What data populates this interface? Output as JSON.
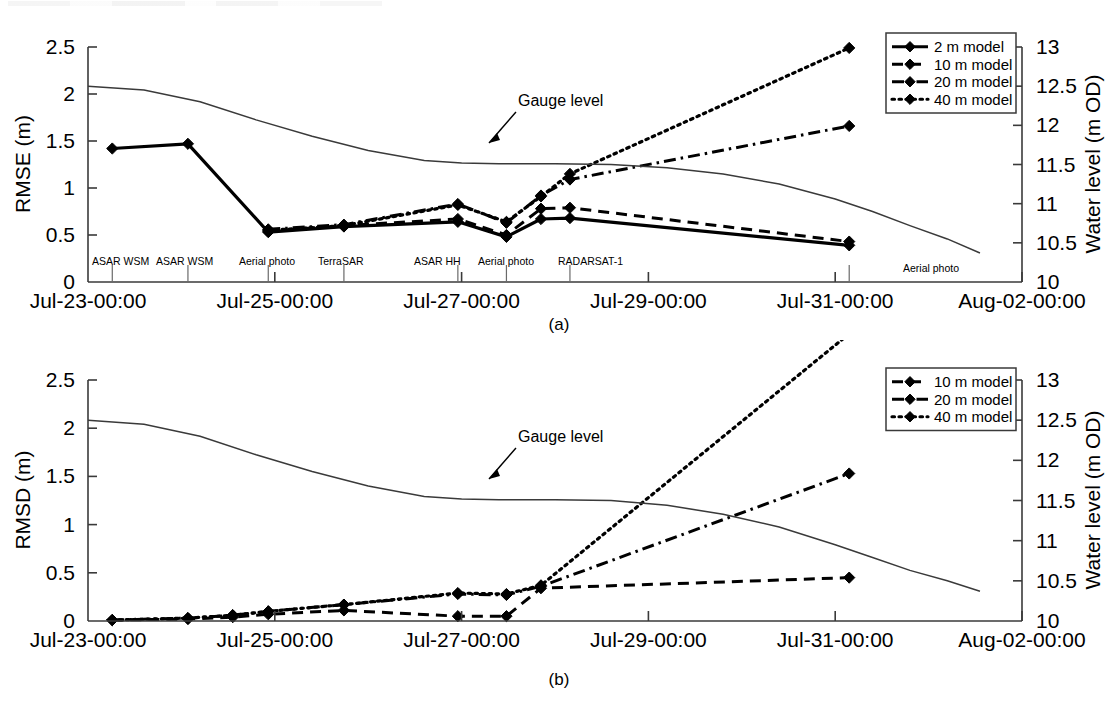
{
  "figure": {
    "width": 1119,
    "height": 712,
    "background": "#ffffff",
    "ink_color": "#000000"
  },
  "panels": [
    {
      "id": "a",
      "caption": "(a)",
      "left_axis_title": "RMSE (m)",
      "right_axis_title": "Water level (m OD)",
      "left_ticks": [
        "0",
        "0.5",
        "1",
        "1.5",
        "2",
        "2.5"
      ],
      "right_ticks": [
        "10",
        "10.5",
        "11",
        "11.5",
        "12",
        "12.5",
        "13"
      ],
      "x_ticks": [
        "Jul-23-00:00",
        "Jul-25-00:00",
        "Jul-27-00:00",
        "Jul-29-00:00",
        "Jul-31-00:00",
        "Aug-02-00:00"
      ],
      "gauge_annotation": "Gauge level",
      "event_labels": [
        "ASAR WSM",
        "ASAR WSM",
        "Aerial photo",
        "TerraSAR",
        "ASAR HH",
        "Aerial photo",
        "RADARSAT-1",
        "Aerial photo"
      ],
      "legend": [
        {
          "label": "2 m model",
          "style": "solid"
        },
        {
          "label": "10 m model",
          "style": "dash"
        },
        {
          "label": "20 m model",
          "style": "dashdot"
        },
        {
          "label": "40 m model",
          "style": "dot"
        }
      ]
    },
    {
      "id": "b",
      "caption": "(b)",
      "left_axis_title": "RMSD (m)",
      "right_axis_title": "Water level (m OD)",
      "left_ticks": [
        "0",
        "0.5",
        "1",
        "1.5",
        "2",
        "2.5"
      ],
      "right_ticks": [
        "10",
        "10.5",
        "11",
        "11.5",
        "12",
        "12.5",
        "13"
      ],
      "x_ticks": [
        "Jul-23-00:00",
        "Jul-25-00:00",
        "Jul-27-00:00",
        "Jul-29-00:00",
        "Jul-31-00:00",
        "Aug-02-00:00"
      ],
      "gauge_annotation": "Gauge level",
      "event_labels": [],
      "legend": [
        {
          "label": "10 m model",
          "style": "dash"
        },
        {
          "label": "20 m model",
          "style": "dashdot"
        },
        {
          "label": "40 m model",
          "style": "dot"
        }
      ]
    }
  ],
  "chart_data": [
    {
      "type": "line",
      "panel": "a",
      "title": "",
      "xlabel": "",
      "ylabel": "RMSE (m)",
      "y2label": "Water level (m OD)",
      "xlim": [
        0,
        10
      ],
      "ylim": [
        0,
        2.5
      ],
      "y2lim": [
        10,
        13
      ],
      "xtick_values": [
        0,
        2,
        4,
        6,
        8,
        10
      ],
      "xtick_labels": [
        "Jul-23-00:00",
        "Jul-25-00:00",
        "Jul-27-00:00",
        "Jul-29-00:00",
        "Jul-31-00:00",
        "Aug-02-00:00"
      ],
      "ytick_values": [
        0,
        0.5,
        1,
        1.5,
        2,
        2.5
      ],
      "y2tick_values": [
        10,
        10.5,
        11,
        11.5,
        12,
        12.5,
        13
      ],
      "grid": false,
      "legend_position": "top-right",
      "series": [
        {
          "name": "2 m model",
          "style": "solid",
          "marker": "diamond",
          "axis": "left",
          "x": [
            0.26,
            1.07,
            1.93,
            2.74,
            3.96,
            4.48,
            4.85,
            5.16,
            8.15
          ],
          "y": [
            1.42,
            1.47,
            0.53,
            0.59,
            0.64,
            0.48,
            0.67,
            0.68,
            0.39
          ]
        },
        {
          "name": "10 m model",
          "style": "dash",
          "marker": "diamond",
          "axis": "left",
          "x": [
            1.93,
            2.74,
            3.96,
            4.48,
            4.85,
            5.16,
            8.15
          ],
          "y": [
            0.54,
            0.6,
            0.67,
            0.5,
            0.78,
            0.79,
            0.43
          ]
        },
        {
          "name": "20 m model",
          "style": "dashdot",
          "marker": "diamond",
          "axis": "left",
          "x": [
            1.93,
            2.74,
            3.96,
            4.48,
            4.85,
            5.16,
            8.15
          ],
          "y": [
            0.56,
            0.61,
            0.83,
            0.63,
            0.92,
            1.09,
            1.66
          ]
        },
        {
          "name": "40 m model",
          "style": "dot",
          "marker": "diamond",
          "axis": "left",
          "x": [
            1.93,
            2.74,
            3.96,
            4.48,
            4.85,
            5.16,
            8.15
          ],
          "y": [
            0.55,
            0.6,
            0.82,
            0.64,
            0.91,
            1.15,
            2.49
          ]
        },
        {
          "name": "Gauge level",
          "style": "thin-solid",
          "marker": "none",
          "axis": "right",
          "x": [
            0.0,
            0.6,
            1.2,
            1.8,
            2.4,
            3.0,
            3.6,
            4.0,
            4.4,
            5.0,
            5.6,
            6.2,
            6.8,
            7.4,
            8.0,
            8.4,
            8.8,
            9.2,
            9.55
          ],
          "y": [
            12.5,
            12.45,
            12.3,
            12.07,
            11.86,
            11.68,
            11.55,
            11.52,
            11.51,
            11.51,
            11.5,
            11.46,
            11.38,
            11.25,
            11.06,
            10.9,
            10.72,
            10.55,
            10.37
          ]
        }
      ],
      "events": [
        {
          "label": "ASAR WSM",
          "x": 0.26
        },
        {
          "label": "ASAR WSM",
          "x": 1.07
        },
        {
          "label": "Aerial photo",
          "x": 1.93
        },
        {
          "label": "TerraSAR",
          "x": 2.74
        },
        {
          "label": "ASAR HH",
          "x": 3.96
        },
        {
          "label": "Aerial photo",
          "x": 4.48
        },
        {
          "label": "RADARSAT-1",
          "x": 5.16
        },
        {
          "label": "Aerial photo",
          "x": 8.15
        }
      ],
      "annotations": [
        {
          "text": "Gauge level",
          "x": 4.55,
          "y": 1.95
        }
      ]
    },
    {
      "type": "line",
      "panel": "b",
      "title": "",
      "xlabel": "",
      "ylabel": "RMSD (m)",
      "y2label": "Water level (m OD)",
      "xlim": [
        0,
        10
      ],
      "ylim": [
        0,
        2.5
      ],
      "y2lim": [
        10,
        13
      ],
      "xtick_values": [
        0,
        2,
        4,
        6,
        8,
        10
      ],
      "xtick_labels": [
        "Jul-23-00:00",
        "Jul-25-00:00",
        "Jul-27-00:00",
        "Jul-29-00:00",
        "Jul-31-00:00",
        "Aug-02-00:00"
      ],
      "ytick_values": [
        0,
        0.5,
        1,
        1.5,
        2,
        2.5
      ],
      "y2tick_values": [
        10,
        10.5,
        11,
        11.5,
        12,
        12.5,
        13
      ],
      "grid": false,
      "legend_position": "top-right",
      "series": [
        {
          "name": "10 m model",
          "style": "dash",
          "marker": "diamond",
          "axis": "left",
          "x": [
            0.26,
            1.07,
            1.55,
            1.93,
            2.74,
            3.96,
            4.48,
            4.85,
            8.15
          ],
          "y": [
            0.01,
            0.02,
            0.04,
            0.07,
            0.11,
            0.05,
            0.05,
            0.34,
            0.45
          ]
        },
        {
          "name": "20 m model",
          "style": "dashdot",
          "marker": "diamond",
          "axis": "left",
          "x": [
            0.26,
            1.07,
            1.55,
            1.93,
            2.74,
            3.96,
            4.48,
            4.85,
            8.15
          ],
          "y": [
            0.01,
            0.03,
            0.06,
            0.1,
            0.17,
            0.28,
            0.27,
            0.36,
            1.53
          ]
        },
        {
          "name": "40 m model",
          "style": "dot",
          "marker": "diamond",
          "axis": "left",
          "x": [
            0.26,
            1.07,
            1.55,
            1.93,
            2.74,
            3.96,
            4.48,
            4.85,
            8.15
          ],
          "y": [
            0.01,
            0.03,
            0.06,
            0.1,
            0.17,
            0.29,
            0.28,
            0.37,
            2.98
          ]
        },
        {
          "name": "Gauge level",
          "style": "thin-solid",
          "marker": "none",
          "axis": "right",
          "x": [
            0.0,
            0.6,
            1.2,
            1.8,
            2.4,
            3.0,
            3.6,
            4.0,
            4.4,
            5.0,
            5.6,
            6.2,
            6.8,
            7.4,
            8.0,
            8.4,
            8.8,
            9.2,
            9.55
          ],
          "y": [
            12.5,
            12.45,
            12.3,
            12.07,
            11.86,
            11.68,
            11.55,
            11.52,
            11.51,
            11.51,
            11.5,
            11.44,
            11.33,
            11.17,
            10.95,
            10.79,
            10.63,
            10.5,
            10.37
          ]
        }
      ],
      "events": [],
      "annotations": [
        {
          "text": "Gauge level",
          "x": 4.55,
          "y": 1.95
        }
      ]
    }
  ]
}
